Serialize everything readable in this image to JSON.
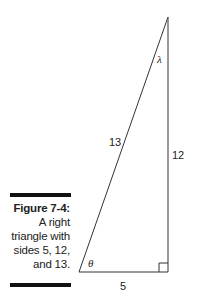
{
  "figure": {
    "caption_title": "Figure 7-4:",
    "caption_lines": [
      "A right",
      "triangle with",
      "sides 5, 12,",
      "and 13."
    ]
  },
  "triangle": {
    "hypotenuse_label": "13",
    "vertical_label": "12",
    "base_label": "5",
    "angle_bottom_left": "θ",
    "angle_top": "λ",
    "line_color": "#333333"
  }
}
